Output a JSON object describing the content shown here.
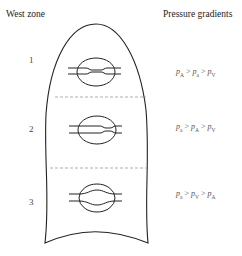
{
  "headers": {
    "left": "West zone",
    "right": "Pressure gradients"
  },
  "zones": [
    {
      "number": "1",
      "gradient": [
        {
          "p": "p",
          "sub": "A"
        },
        {
          "op": ">"
        },
        {
          "p": "p",
          "sub": "a"
        },
        {
          "op": ">"
        },
        {
          "p": "p",
          "sub": "V"
        }
      ],
      "gradient_text": "pA > pa > pV"
    },
    {
      "number": "2",
      "gradient": [
        {
          "p": "p",
          "sub": "a"
        },
        {
          "op": ">"
        },
        {
          "p": "p",
          "sub": "A"
        },
        {
          "op": ">"
        },
        {
          "p": "p",
          "sub": "V"
        }
      ],
      "gradient_text": "pa > pA > pV"
    },
    {
      "number": "3",
      "gradient": [
        {
          "p": "p",
          "sub": "a"
        },
        {
          "op": ">"
        },
        {
          "p": "p",
          "sub": "V"
        },
        {
          "op": ">"
        },
        {
          "p": "p",
          "sub": "A"
        }
      ],
      "gradient_text": "pa > pV > pA"
    }
  ],
  "colors": {
    "outline": "#222222",
    "divider": "#999999",
    "text": "#444444"
  }
}
